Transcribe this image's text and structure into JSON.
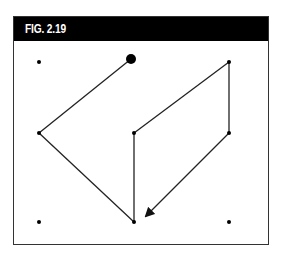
{
  "figure": {
    "label": "FIG. 2.19",
    "colors": {
      "header_bg": "#000000",
      "header_text": "#ffffff",
      "line": "#222222",
      "frame": "#333333"
    },
    "dots": [
      {
        "id": "top-left",
        "x": 39,
        "y": 62,
        "r": 2
      },
      {
        "id": "top-middle-start",
        "x": 131,
        "y": 59,
        "r": 5,
        "start": true
      },
      {
        "id": "top-right",
        "x": 229,
        "y": 62,
        "r": 2
      },
      {
        "id": "middle-left",
        "x": 39,
        "y": 133,
        "r": 2
      },
      {
        "id": "middle-center",
        "x": 134,
        "y": 133,
        "r": 2
      },
      {
        "id": "middle-right",
        "x": 229,
        "y": 133,
        "r": 2
      },
      {
        "id": "bottom-left",
        "x": 39,
        "y": 222,
        "r": 2
      },
      {
        "id": "bottom-middle",
        "x": 134,
        "y": 222,
        "r": 2
      },
      {
        "id": "bottom-right",
        "x": 229,
        "y": 222,
        "r": 2
      }
    ],
    "path": [
      {
        "from": "top-middle-start",
        "to": "middle-left"
      },
      {
        "from": "middle-left",
        "to": "bottom-middle"
      },
      {
        "from": "bottom-middle",
        "to": "middle-center"
      },
      {
        "from": "middle-center",
        "to": "top-right"
      },
      {
        "from": "top-right",
        "to": "middle-right"
      },
      {
        "from": "middle-right",
        "to": "arrow-tip",
        "arrow": true
      }
    ],
    "arrow_tip": {
      "x": 146,
      "y": 216
    }
  }
}
